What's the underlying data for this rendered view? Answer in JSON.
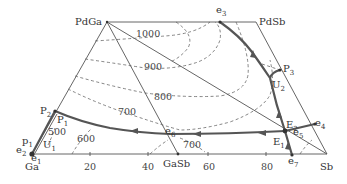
{
  "diagram": {
    "type": "ternary-phase-diagram-liquidus-projection",
    "vertices": {
      "PdGa": "PdGa",
      "PdSb": "PdSb",
      "Ga": "Ga",
      "Sb": "Sb",
      "GaSb": "GaSb"
    },
    "axis_ticks": [
      "20",
      "40",
      "60",
      "80"
    ],
    "isotherms": [
      "1000",
      "900",
      "800",
      "700",
      "700",
      "600",
      "500"
    ],
    "points": {
      "e1": {
        "main": "e",
        "sub": "1"
      },
      "e2": {
        "main": "e",
        "sub": "2"
      },
      "e3": {
        "main": "e",
        "sub": "3"
      },
      "e4": {
        "main": "e",
        "sub": "4"
      },
      "e5": {
        "main": "e",
        "sub": "5"
      },
      "e6": {
        "main": "e",
        "sub": "6"
      },
      "e7": {
        "main": "e",
        "sub": "7"
      },
      "p1": {
        "main": "p",
        "sub": "1"
      },
      "P1": {
        "main": "P",
        "sub": "1"
      },
      "P2": {
        "main": "P",
        "sub": "2"
      },
      "P3": {
        "main": "P",
        "sub": "3"
      },
      "U1": {
        "main": "U",
        "sub": "1"
      },
      "U2": {
        "main": "U",
        "sub": "2"
      },
      "E1": {
        "main": "E",
        "sub": "1"
      },
      "E2": {
        "main": "E",
        "sub": "2"
      }
    }
  }
}
